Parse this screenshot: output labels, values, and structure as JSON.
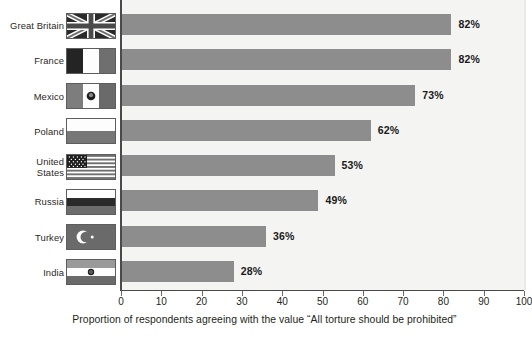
{
  "chart_data": {
    "type": "bar",
    "orientation": "horizontal",
    "title": "",
    "xlabel": "Proportion of respondents agreeing with the value \"All torture should be prohibited\"",
    "ylabel": "",
    "xlim": [
      0,
      100
    ],
    "xticks": [
      0,
      10,
      20,
      30,
      40,
      50,
      60,
      70,
      80,
      90,
      100
    ],
    "grid": false,
    "legend": null,
    "categories": [
      "Great Britain",
      "France",
      "Mexico",
      "Poland",
      "United States",
      "Russia",
      "Turkey",
      "India"
    ],
    "values": [
      82,
      82,
      73,
      62,
      53,
      49,
      36,
      28
    ],
    "value_labels": [
      "82%",
      "82%",
      "73%",
      "62%",
      "53%",
      "49%",
      "36%",
      "28%"
    ],
    "bar_color": "#8d8d8d",
    "plot_background": "#f4f4f2",
    "axis_color": "#4a4a4a"
  },
  "rows": [
    {
      "country": "Great Britain",
      "flag": "flag-great-britain",
      "value": 82,
      "label": "82%"
    },
    {
      "country": "France",
      "flag": "flag-france",
      "value": 82,
      "label": "82%"
    },
    {
      "country": "Mexico",
      "flag": "flag-mexico",
      "value": 73,
      "label": "73%"
    },
    {
      "country": "Poland",
      "flag": "flag-poland",
      "value": 62,
      "label": "62%"
    },
    {
      "country": "United\nStates",
      "flag": "flag-united-states",
      "value": 53,
      "label": "53%"
    },
    {
      "country": "Russia",
      "flag": "flag-russia",
      "value": 49,
      "label": "49%"
    },
    {
      "country": "Turkey",
      "flag": "flag-turkey",
      "value": 36,
      "label": "36%"
    },
    {
      "country": "India",
      "flag": "flag-india",
      "value": 28,
      "label": "28%"
    }
  ],
  "axis": {
    "ticks": [
      "0",
      "10",
      "20",
      "30",
      "40",
      "50",
      "60",
      "70",
      "80",
      "90",
      "100"
    ],
    "caption": "Proportion of respondents agreeing with the value “All torture should be prohibited”"
  }
}
